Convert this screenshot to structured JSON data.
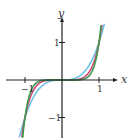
{
  "chart_data": {
    "type": "line",
    "title": "",
    "xlabel": "x",
    "ylabel": "y",
    "xlim": [
      -1.6,
      1.6
    ],
    "ylim": [
      -1.6,
      1.6
    ],
    "grid": false,
    "legend": "none",
    "x_ticks": [
      {
        "value": -1,
        "label": "−1"
      },
      {
        "value": 1,
        "label": "1"
      }
    ],
    "y_ticks": [
      {
        "value": 1,
        "label": "1"
      },
      {
        "value": -1,
        "label": "−1"
      }
    ],
    "series": [
      {
        "name": "y = x^3",
        "exponent": 3,
        "color": "#6ec3e6"
      },
      {
        "name": "y = x^5",
        "exponent": 5,
        "color": "#d0487a"
      },
      {
        "name": "y = x^7",
        "exponent": 7,
        "color": "#3a9a4a"
      }
    ],
    "axis_color": "#222222"
  }
}
